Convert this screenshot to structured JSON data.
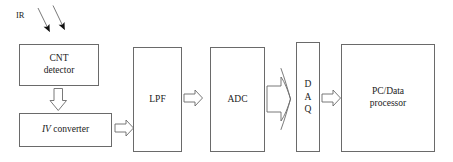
{
  "diagram": {
    "type": "block-diagram",
    "background_color": "#ffffff",
    "stroke_color": "#6a6a6a",
    "text_color": "#1a1a1a",
    "input_label": "IR",
    "blocks": [
      {
        "id": "cnt-detector",
        "lines": [
          "CNT",
          "detector"
        ]
      },
      {
        "id": "iv-converter",
        "lines": [
          "IV converter"
        ],
        "italic_prefix": "IV",
        "plain_rest": " converter"
      },
      {
        "id": "lpf",
        "lines": [
          "LPF"
        ]
      },
      {
        "id": "adc",
        "lines": [
          "ADC"
        ]
      },
      {
        "id": "daq",
        "lines": [
          "D",
          "A",
          "Q"
        ]
      },
      {
        "id": "pc-processor",
        "lines": [
          "PC/Data",
          "processor"
        ]
      }
    ],
    "connectors": [
      {
        "id": "ir-ray-1",
        "kind": "solid-arrow",
        "from": "ir-label",
        "to": "cnt-detector",
        "direction": "down-left"
      },
      {
        "id": "ir-ray-2",
        "kind": "solid-arrow",
        "from": "ir-label",
        "to": "cnt-detector",
        "direction": "down-left"
      },
      {
        "id": "cnt-to-iv",
        "kind": "hollow-arrow",
        "from": "cnt-detector",
        "to": "iv-converter",
        "direction": "down"
      },
      {
        "id": "iv-to-lpf",
        "kind": "hollow-arrow",
        "from": "iv-converter",
        "to": "lpf",
        "direction": "right"
      },
      {
        "id": "lpf-to-adc",
        "kind": "hollow-arrow",
        "from": "lpf",
        "to": "adc",
        "direction": "right"
      },
      {
        "id": "adc-to-daq",
        "kind": "hollow-bus-arrow",
        "from": "adc",
        "to": "daq",
        "direction": "right"
      },
      {
        "id": "daq-to-pc",
        "kind": "hollow-arrow",
        "from": "daq",
        "to": "pc-processor",
        "direction": "right"
      }
    ]
  }
}
